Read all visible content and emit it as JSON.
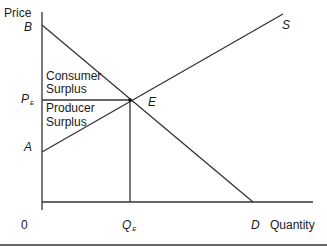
{
  "diagram": {
    "y_axis_label": "Price",
    "x_axis_label": "Quantity",
    "origin_label": "0",
    "points": {
      "B": "B",
      "A": "A",
      "E": "E",
      "S": "S",
      "D": "D"
    },
    "price_label": {
      "main": "P",
      "sub": "E"
    },
    "quantity_label": {
      "main": "Q",
      "sub": "E"
    },
    "regions": {
      "consumer_surplus": [
        "Consumer",
        "Surplus"
      ],
      "producer_surplus": [
        "Producer",
        "Surplus"
      ]
    },
    "curves": [
      {
        "name": "Demand",
        "from": "B",
        "to": "D"
      },
      {
        "name": "Supply",
        "from": "A",
        "to": "S"
      }
    ],
    "colors": {
      "line": "#333333",
      "text": "#1a1a1a",
      "background": "#ffffff"
    }
  }
}
